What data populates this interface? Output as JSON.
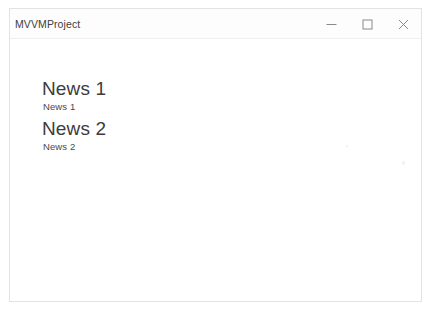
{
  "window": {
    "title": "MVVMProject",
    "controls": [
      {
        "name": "minimize-button",
        "icon": "minimize-icon",
        "label": "—"
      },
      {
        "name": "maximize-button",
        "icon": "maximize-icon",
        "label": "□"
      },
      {
        "name": "close-button",
        "icon": "close-icon",
        "label": "×"
      }
    ]
  },
  "colors": {
    "window_background": "#ffffff",
    "window_border": "#e3e3e3",
    "title_text": "#404040",
    "heading_text": "#3c3c3c",
    "body_text": "#4a4a4a",
    "control_glyph": "#8a8a8a"
  },
  "news": {
    "items": [
      {
        "title": "News 1",
        "description": "News 1"
      },
      {
        "title": "News 2",
        "description": "News 2"
      }
    ]
  }
}
